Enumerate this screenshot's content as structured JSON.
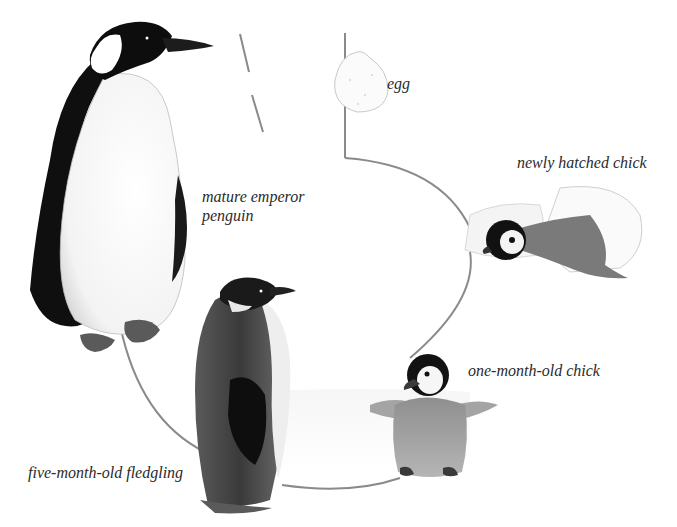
{
  "diagram": {
    "stages": [
      {
        "id": "egg",
        "label": "egg"
      },
      {
        "id": "hatchling",
        "label": "newly hatched chick"
      },
      {
        "id": "one-month",
        "label": "one-month-old chick"
      },
      {
        "id": "fledgling",
        "label": "five-month-old fledgling"
      },
      {
        "id": "adult",
        "label_line1": "mature emperor",
        "label_line2": "penguin"
      }
    ],
    "colors": {
      "line": "#8a8a8a",
      "ink": "#111111",
      "label": "#2a2a2a",
      "chick_down": "#9a9a9a"
    }
  }
}
